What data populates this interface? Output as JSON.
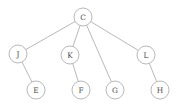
{
  "figure": {
    "name": "tree-graph",
    "background_color": "#ffffff",
    "node_fill": "#ffffff",
    "node_stroke": "#9a9a9a",
    "edge_color": "#9a9a9a",
    "label_color": "#4a4a4a",
    "node_radius": 9
  },
  "chart_data": {
    "type": "diagram",
    "title": "",
    "nodes": [
      {
        "id": "C",
        "label": "C",
        "x": 83,
        "y": 17,
        "level": 0
      },
      {
        "id": "J",
        "label": "J",
        "x": 18,
        "y": 54,
        "level": 1
      },
      {
        "id": "K",
        "label": "K",
        "x": 70,
        "y": 55,
        "level": 1
      },
      {
        "id": "L",
        "label": "L",
        "x": 146,
        "y": 55,
        "level": 1
      },
      {
        "id": "E",
        "label": "E",
        "x": 36,
        "y": 90,
        "level": 2
      },
      {
        "id": "F",
        "label": "F",
        "x": 81,
        "y": 90,
        "level": 2
      },
      {
        "id": "G",
        "label": "G",
        "x": 115,
        "y": 90,
        "level": 2
      },
      {
        "id": "H",
        "label": "H",
        "x": 160,
        "y": 90,
        "level": 2
      }
    ],
    "edges": [
      {
        "from": "C",
        "to": "J"
      },
      {
        "from": "C",
        "to": "K"
      },
      {
        "from": "C",
        "to": "G"
      },
      {
        "from": "C",
        "to": "L"
      },
      {
        "from": "J",
        "to": "E"
      },
      {
        "from": "K",
        "to": "F"
      },
      {
        "from": "L",
        "to": "H"
      }
    ]
  }
}
